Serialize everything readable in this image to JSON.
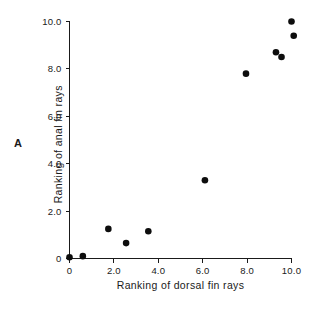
{
  "figure": {
    "panel_letter": "A",
    "background_color": "#ffffff",
    "ink_color": "#1a1a1a"
  },
  "chart_data": {
    "type": "scatter",
    "title": "",
    "subtitle": "",
    "xlabel": "Ranking of dorsal fin rays",
    "ylabel": "Ranking of anal fin rays",
    "xlim": [
      0,
      10
    ],
    "ylim": [
      0,
      10
    ],
    "xticks": [
      0,
      2.0,
      4.0,
      6.0,
      8.0,
      10.0
    ],
    "xtick_labels": [
      "0",
      "2.0",
      "4.0",
      "6.0",
      "8.0",
      "10.0"
    ],
    "yticks": [
      0,
      2.0,
      4.0,
      6.0,
      8.0,
      10.0
    ],
    "ytick_labels": [
      "0",
      "2.0",
      "4.0",
      "6.0",
      "8.0",
      "10.0"
    ],
    "grid": false,
    "legend": null,
    "legend_position": "none",
    "marker": "filled-circle",
    "marker_color": "#0d0d0d",
    "marker_size_px": 4.6,
    "annotations": [
      "A"
    ],
    "series": [
      {
        "name": "dorsal vs anal fin ray rankings",
        "points": [
          {
            "x": 0.0,
            "y": 0.05
          },
          {
            "x": 0.6,
            "y": 0.1
          },
          {
            "x": 1.75,
            "y": 1.25
          },
          {
            "x": 2.55,
            "y": 0.65
          },
          {
            "x": 3.55,
            "y": 1.15
          },
          {
            "x": 6.1,
            "y": 3.3
          },
          {
            "x": 7.95,
            "y": 7.8
          },
          {
            "x": 9.3,
            "y": 8.7
          },
          {
            "x": 9.55,
            "y": 8.5
          },
          {
            "x": 10.0,
            "y": 10.0
          },
          {
            "x": 10.1,
            "y": 9.4
          }
        ]
      }
    ]
  }
}
